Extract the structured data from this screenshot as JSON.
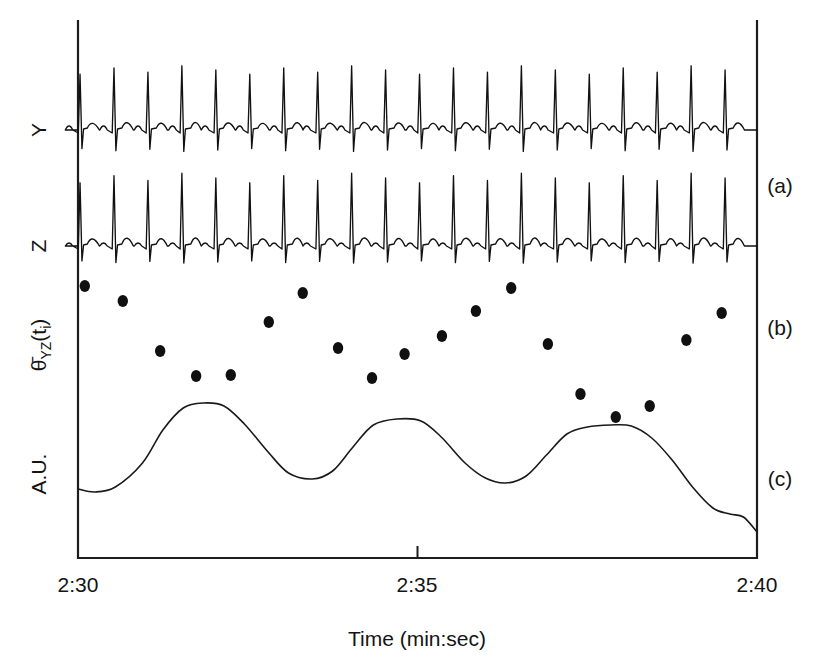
{
  "figure": {
    "axis": {
      "xlabel": "Time (min:sec)",
      "xticks": [
        "2:30",
        "2:35",
        "2:40"
      ],
      "xtick_positions": [
        0,
        5,
        10
      ],
      "xlim": [
        0,
        10
      ],
      "x_unit": "seconds elapsed from 2:30"
    },
    "row_labels": {
      "y_trace": "Y",
      "z_trace": "Z",
      "theta_main": "θ",
      "theta_overbar": true,
      "theta_sub": "YZ",
      "theta_arg_open": "(t",
      "theta_arg_sub": "i",
      "theta_arg_close": ")",
      "theta_full": "θ̄YZ(ti)",
      "au": "A.U."
    },
    "panel_labels": [
      "(a)",
      "(b)",
      "(c)"
    ],
    "colors": {
      "ink": "#141414",
      "trace": "#121212",
      "marker": "#101010",
      "background": "#ffffff"
    }
  },
  "chart_data": {
    "type": "line",
    "title": "",
    "xlabel": "Time (min:sec)",
    "ylabel": "",
    "xlim": [
      0,
      10
    ],
    "grid": false,
    "legend": "none",
    "panels": [
      {
        "id": "a",
        "label": "(a)",
        "description": "Two-channel vectorcardiogram ECG leads Y and Z",
        "series": [
          {
            "name": "Y",
            "type": "ecg",
            "ylabel": "Y",
            "baseline": 130,
            "r_peak_y": 70,
            "s_trough_y": 150,
            "p_wave_y": 122,
            "t_wave_y": 117,
            "beat_count": 20,
            "beat_period_s": 0.5,
            "first_beat_s": 0.03,
            "r_amplitude_rel": 1.0,
            "t_amplitude_rel": 0.22
          },
          {
            "name": "Z",
            "type": "ecg",
            "ylabel": "Z",
            "baseline": 246,
            "r_peak_y": 178,
            "s_trough_y": 262,
            "p_wave_y": 240,
            "t_wave_y": 232,
            "beat_count": 20,
            "beat_period_s": 0.5,
            "first_beat_s": 0.03,
            "r_amplitude_rel": 1.35,
            "t_amplitude_rel": 0.26
          }
        ]
      },
      {
        "id": "b",
        "label": "(b)",
        "description": "Mean QRS vector angle in the YZ plane, one marker per beat",
        "ylabel": "θ̄YZ(ti)",
        "marker": "filled-circle",
        "points": [
          {
            "x": 0.1,
            "y": 286
          },
          {
            "x": 0.66,
            "y": 301
          },
          {
            "x": 1.21,
            "y": 351
          },
          {
            "x": 1.74,
            "y": 376
          },
          {
            "x": 2.25,
            "y": 375
          },
          {
            "x": 2.81,
            "y": 322
          },
          {
            "x": 3.31,
            "y": 293
          },
          {
            "x": 3.83,
            "y": 348
          },
          {
            "x": 4.33,
            "y": 378
          },
          {
            "x": 4.81,
            "y": 354
          },
          {
            "x": 5.36,
            "y": 336
          },
          {
            "x": 5.86,
            "y": 311
          },
          {
            "x": 6.38,
            "y": 288
          },
          {
            "x": 6.92,
            "y": 344
          },
          {
            "x": 7.4,
            "y": 394
          },
          {
            "x": 7.92,
            "y": 417
          },
          {
            "x": 8.42,
            "y": 406
          },
          {
            "x": 8.96,
            "y": 340
          },
          {
            "x": 9.48,
            "y": 313
          }
        ]
      },
      {
        "id": "c",
        "label": "(c)",
        "description": "Respiratory signal in arbitrary units",
        "ylabel": "A.U.",
        "points": [
          {
            "x": 0.0,
            "y": 489
          },
          {
            "x": 0.25,
            "y": 492
          },
          {
            "x": 0.55,
            "y": 487
          },
          {
            "x": 0.95,
            "y": 463
          },
          {
            "x": 1.25,
            "y": 430
          },
          {
            "x": 1.55,
            "y": 408
          },
          {
            "x": 1.85,
            "y": 403
          },
          {
            "x": 2.15,
            "y": 406
          },
          {
            "x": 2.45,
            "y": 424
          },
          {
            "x": 2.8,
            "y": 452
          },
          {
            "x": 3.1,
            "y": 473
          },
          {
            "x": 3.45,
            "y": 479
          },
          {
            "x": 3.75,
            "y": 471
          },
          {
            "x": 4.05,
            "y": 447
          },
          {
            "x": 4.35,
            "y": 425
          },
          {
            "x": 4.7,
            "y": 419
          },
          {
            "x": 5.05,
            "y": 421
          },
          {
            "x": 5.35,
            "y": 437
          },
          {
            "x": 5.7,
            "y": 463
          },
          {
            "x": 6.0,
            "y": 478
          },
          {
            "x": 6.3,
            "y": 483
          },
          {
            "x": 6.6,
            "y": 476
          },
          {
            "x": 6.9,
            "y": 455
          },
          {
            "x": 7.2,
            "y": 434
          },
          {
            "x": 7.5,
            "y": 427
          },
          {
            "x": 7.85,
            "y": 425
          },
          {
            "x": 8.15,
            "y": 426
          },
          {
            "x": 8.45,
            "y": 438
          },
          {
            "x": 8.75,
            "y": 460
          },
          {
            "x": 9.05,
            "y": 487
          },
          {
            "x": 9.35,
            "y": 508
          },
          {
            "x": 9.6,
            "y": 514
          },
          {
            "x": 9.8,
            "y": 517
          },
          {
            "x": 10.0,
            "y": 532
          }
        ]
      }
    ]
  }
}
